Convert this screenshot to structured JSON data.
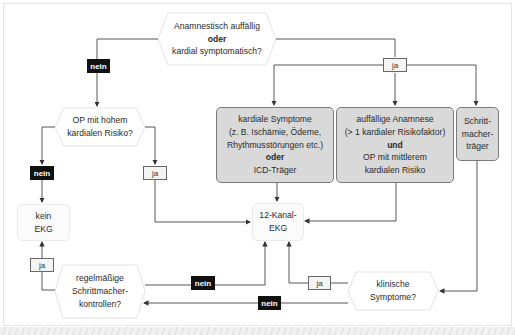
{
  "colors": {
    "action_box_fill": "#d9d9d9",
    "action_box_border": "#7a7a7a",
    "terminal_box_fill": "#fbfbfb",
    "decision_fill": "#ffffff",
    "no_label_bg": "#111111",
    "yes_label_bg": "#f4f4f4",
    "line": "#333333"
  },
  "decisions": {
    "top": {
      "line1": "Anamnestisch auffällig",
      "line2": "oder",
      "line3": "kardial symptomatisch?"
    },
    "op_risk": {
      "line1": "OP mit hohem",
      "line2": "kardialen Risiko?"
    },
    "pacemaker_checks": {
      "line1": "regelmäßige",
      "line2": "Schrittmacher-",
      "line3": "kontrollen?"
    },
    "clinical_symptoms": {
      "line1": "klinische",
      "line2": "Symptome?"
    }
  },
  "boxes": {
    "cardiac_symptoms": {
      "line1": "kardiale Symptome",
      "line2": "(z. B. Ischämie, Ödeme,",
      "line3": "Rhythmusstörungen etc.)",
      "line4": "oder",
      "line5": "ICD-Träger"
    },
    "abnormal_history": {
      "line1": "auffällige Anamnese",
      "line2": "(> 1 kardialer Risikofaktor)",
      "line3": "und",
      "line4": "OP mit mittlerem",
      "line5": "kardialen Risiko"
    },
    "pacemaker_carrier": {
      "line1": "Schritt-",
      "line2": "macher-",
      "line3": "träger"
    }
  },
  "terminals": {
    "no_ecg": {
      "line1": "kein",
      "line2": "EKG"
    },
    "ecg_12": {
      "line1": "12-Kanal-",
      "line2": "EKG"
    }
  },
  "labels": {
    "top_no": "nein",
    "top_yes": "ja",
    "op_no": "nein",
    "op_yes": "ja",
    "checks_yes": "ja",
    "checks_no": "nein",
    "clinical_yes": "ja",
    "clinical_no": "nein"
  }
}
